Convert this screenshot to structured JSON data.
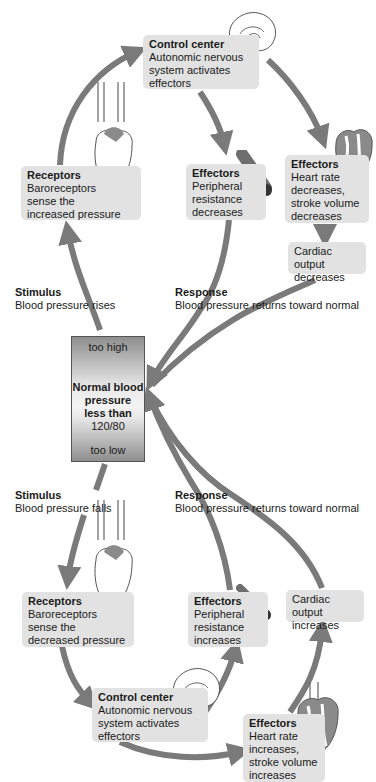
{
  "colors": {
    "arrow": "#7a7a7a",
    "box_bg": "#e2e2e2",
    "heart_fill": "#8a8a8a",
    "vessel": "#6e6e6e"
  },
  "center": {
    "top_label": "too high",
    "title_lines": [
      "Normal blood",
      "pressure",
      "less than"
    ],
    "value": "120/80",
    "bottom_label": "too low"
  },
  "upper_loop": {
    "stimulus": {
      "title": "Stimulus",
      "body": "Blood pressure rises"
    },
    "receptors": {
      "title": "Receptors",
      "body": "Baroreceptors\nsense the\nincreased pressure"
    },
    "control_center": {
      "title": "Control center",
      "body": "Autonomic nervous\nsystem activates\neffectors"
    },
    "effectors_vessels": {
      "title": "Effectors",
      "body": "Peripheral\nresistance\ndecreases"
    },
    "effectors_heart": {
      "title": "Effectors",
      "body": "Heart rate\ndecreases,\nstroke volume\ndecreases"
    },
    "cardiac_output": {
      "body": "Cardiac output\ndecreases"
    },
    "response": {
      "title": "Response",
      "body": "Blood pressure returns toward normal"
    }
  },
  "lower_loop": {
    "stimulus": {
      "title": "Stimulus",
      "body": "Blood pressure falls"
    },
    "receptors": {
      "title": "Receptors",
      "body": "Baroreceptors\nsense the\ndecreased pressure"
    },
    "control_center": {
      "title": "Control center",
      "body": "Autonomic nervous\nsystem activates\neffectors"
    },
    "effectors_vessels": {
      "title": "Effectors",
      "body": "Peripheral\nresistance\nincreases"
    },
    "effectors_heart": {
      "title": "Effectors",
      "body": "Heart rate\nincreases,\nstroke volume\nincreases"
    },
    "cardiac_output": {
      "body": "Cardiac output\nincreases"
    },
    "response": {
      "title": "Response",
      "body": "Blood pressure returns toward normal"
    }
  },
  "icons": [
    "brain-icon",
    "heart-icon",
    "blood-vessel-icon"
  ]
}
